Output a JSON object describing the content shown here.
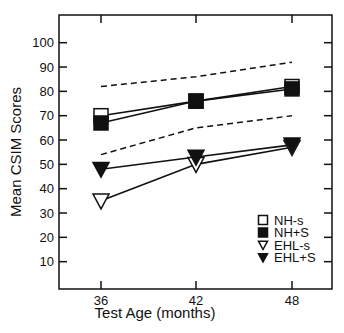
{
  "chart_data": {
    "type": "line",
    "title": "",
    "xlabel": "Test Age (months)",
    "ylabel": "Mean CSIM Scores",
    "x": [
      36,
      42,
      48
    ],
    "xticks": [
      "36",
      "42",
      "48"
    ],
    "yticks": [
      "10",
      "20",
      "30",
      "40",
      "50",
      "60",
      "70",
      "80",
      "90",
      "100"
    ],
    "ylim": [
      0,
      110
    ],
    "grid": false,
    "legend_position": "lower right",
    "series": [
      {
        "name": "NH-s",
        "marker": "open-square",
        "values": [
          70,
          76,
          82
        ]
      },
      {
        "name": "NH+S",
        "marker": "filled-square",
        "values": [
          67,
          76,
          81
        ]
      },
      {
        "name": "EHL-s",
        "marker": "open-triangle-down",
        "values": [
          35,
          50,
          57
        ]
      },
      {
        "name": "EHL+S",
        "marker": "filled-triangle-down",
        "values": [
          48,
          53,
          58
        ]
      }
    ],
    "reference_lines": [
      {
        "name": "upper-dashed",
        "style": "dashed",
        "values": [
          82,
          86,
          92
        ]
      },
      {
        "name": "lower-dashed",
        "style": "dashed",
        "values": [
          54,
          65,
          70
        ]
      }
    ]
  },
  "legend": {
    "items": [
      {
        "label": "NH-s",
        "icon": "open-square"
      },
      {
        "label": "NH+S",
        "icon": "filled-square"
      },
      {
        "label": "EHL-s",
        "icon": "open-triangle-down"
      },
      {
        "label": "EHL+S",
        "icon": "filled-triangle-down"
      }
    ]
  },
  "colors": {
    "ink": "#111111",
    "background": "#ffffff"
  }
}
